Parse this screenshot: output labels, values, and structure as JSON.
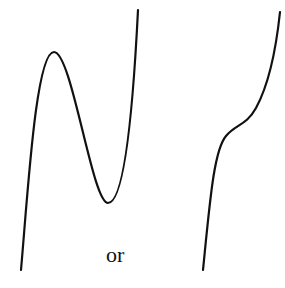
{
  "diagram": {
    "left_curve": {
      "label": "cubic with local maximum and local minimum",
      "path": "M21,270 C28,190 36,52 54,52 C72,52 92,203 108,203 C126,203 134,90 138,10"
    },
    "right_curve": {
      "label": "monotonic cubic with inflection point",
      "path": "M203,270 C210,200 214,150 226,136 C236,124 246,126 256,108 C268,86 276,50 280,12"
    },
    "connector_text": "or",
    "colors": {
      "stroke": "#111111",
      "background": "#ffffff"
    }
  }
}
